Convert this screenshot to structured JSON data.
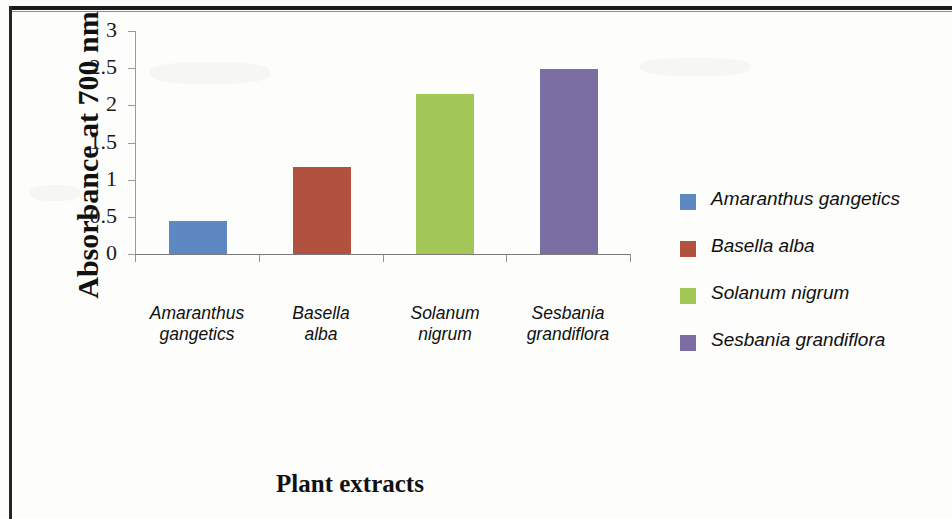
{
  "chart_data": {
    "type": "bar",
    "title": "",
    "xlabel": "Plant extracts",
    "ylabel": "Absorbance at 700 nm",
    "categories": [
      "Amaranthus gangetics",
      "Basella alba",
      "Solanum nigrum",
      "Sesbania grandiflora"
    ],
    "category_lines": [
      [
        "Amaranthus",
        "gangetics"
      ],
      [
        "Basella",
        "alba"
      ],
      [
        "Solanum",
        "nigrum"
      ],
      [
        "Sesbania",
        "grandiflora"
      ]
    ],
    "values": [
      0.42,
      1.15,
      2.13,
      2.46
    ],
    "ylim": [
      0,
      3
    ],
    "yticks": [
      "0",
      "0.5",
      "1",
      "1.5",
      "2",
      "2.5",
      "3"
    ],
    "ytick_values": [
      0,
      0.5,
      1,
      1.5,
      2,
      2.5,
      3
    ],
    "grid": false,
    "legend_position": "right",
    "colors": [
      "#5e88c1",
      "#b0523f",
      "#a3c757",
      "#7a6ea2"
    ],
    "series": [
      {
        "name": "Amaranthus gangetics",
        "value": 0.42,
        "color": "#5e88c1"
      },
      {
        "name": "Basella alba",
        "value": 1.15,
        "color": "#b0523f"
      },
      {
        "name": "Solanum nigrum",
        "value": 2.13,
        "color": "#a3c757"
      },
      {
        "name": "Sesbania grandiflora",
        "value": 2.46,
        "color": "#7a6ea2"
      }
    ]
  },
  "legend": {
    "items": [
      {
        "label": "Amaranthus  gangetics",
        "color": "#5e88c1"
      },
      {
        "label": "Basella alba",
        "color": "#b0523f"
      },
      {
        "label": "Solanum nigrum",
        "color": "#a3c757"
      },
      {
        "label": "Sesbania grandiflora",
        "color": "#7a6ea2"
      }
    ]
  }
}
